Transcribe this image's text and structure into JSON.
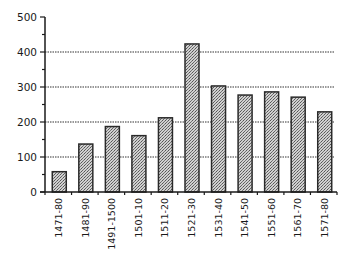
{
  "chart_data": {
    "type": "bar",
    "title": "",
    "xlabel": "",
    "ylabel": "",
    "categories": [
      "1471-80",
      "1481-90",
      "1491-1500",
      "1501-10",
      "1511-20",
      "1521-30",
      "1531-40",
      "1541-50",
      "1551-60",
      "1561-70",
      "1571-80"
    ],
    "values": [
      58,
      137,
      187,
      161,
      212,
      423,
      303,
      277,
      286,
      271,
      229
    ],
    "ylim": [
      0,
      500
    ],
    "yticks": [
      0,
      100,
      200,
      300,
      400,
      500
    ],
    "ytick_labels": [
      "0",
      "100",
      "200",
      "300",
      "400",
      "500"
    ],
    "grid": {
      "horizontal": true,
      "style": "dotted",
      "lines_at": [
        100,
        200,
        300,
        400
      ]
    },
    "legend": null,
    "bar_fill": "stippled gray",
    "colors": {
      "bar_fill": "#9a9a9a",
      "bar_edge": "#2a2a2a",
      "axis": "#1a1a1a",
      "grid": "#333333"
    }
  }
}
